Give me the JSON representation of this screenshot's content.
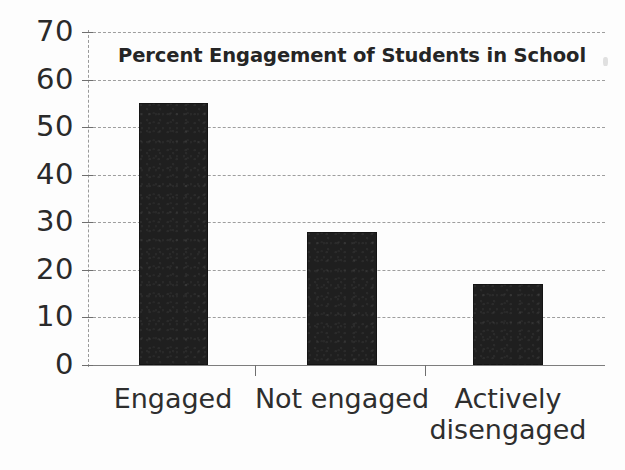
{
  "chart_data": {
    "type": "bar",
    "title": "Percent Engagement of Students in School",
    "categories": [
      "Engaged",
      "Not engaged",
      "Actively\ndisengaged"
    ],
    "values": [
      55,
      28,
      17
    ],
    "xlabel": "",
    "ylabel": "",
    "ylim": [
      0,
      70
    ],
    "ytick_values": [
      70,
      60,
      50,
      40,
      30,
      20,
      10,
      0
    ],
    "ytick_labels": [
      "70",
      "60",
      "50",
      "40",
      "30",
      "20",
      "10",
      "0"
    ],
    "ytick_step": 10,
    "grid": true,
    "grid_style": "dashed-horizontal",
    "legend": "none",
    "bar_color": "#1f1f1f",
    "grid_color": "#8e8e8e",
    "axis_color": "#6f6f6f",
    "background_color": "#fdfdfd",
    "text_color": "#2a2a2a",
    "units": "percent"
  },
  "axis": {
    "y_ticks": [
      {
        "label": "70",
        "value": 70
      },
      {
        "label": "60",
        "value": 60
      },
      {
        "label": "50",
        "value": 50
      },
      {
        "label": "40",
        "value": 40
      },
      {
        "label": "30",
        "value": 30
      },
      {
        "label": "20",
        "value": 20
      },
      {
        "label": "10",
        "value": 10
      },
      {
        "label": "0",
        "value": 0
      }
    ]
  },
  "bars": [
    {
      "label": "Engaged",
      "value": 55
    },
    {
      "label": "Not engaged",
      "value": 28
    },
    {
      "label": "Actively\ndisengaged",
      "value": 17
    }
  ]
}
